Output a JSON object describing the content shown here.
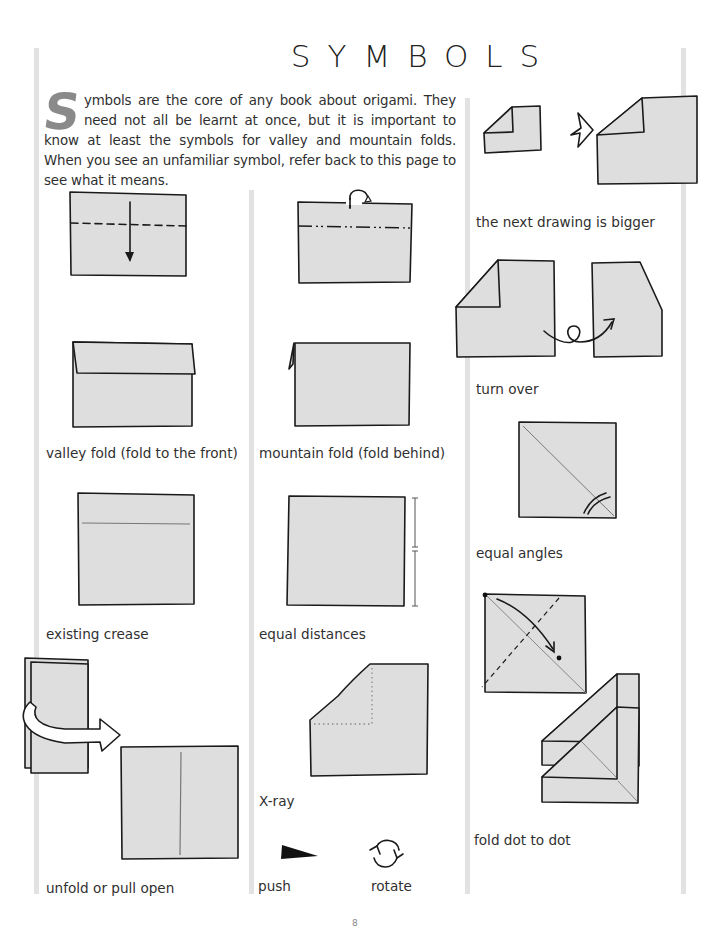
{
  "page": {
    "title": "SYMBOLS",
    "intro_dropcap": "S",
    "intro_text": "ymbols are the core of any book about origami. They need not all be learnt at once, but it is important to know at least the symbols for valley and mountain folds. When you see an unfamiliar symbol, refer back to this page to see what it means.",
    "page_number": "8"
  },
  "colors": {
    "paper_fill": "#dedede",
    "ink": "#1a1a1a",
    "rule": "#e2e2e2",
    "dropcap": "#8a8a8a"
  },
  "symbols": [
    {
      "id": "valley-fold",
      "caption": "valley fold (fold to the front)",
      "icon": "valley-fold-diagram"
    },
    {
      "id": "mountain-fold",
      "caption": "mountain fold (fold behind)",
      "icon": "mountain-fold-diagram"
    },
    {
      "id": "existing-crease",
      "caption": "existing crease",
      "icon": "existing-crease-diagram"
    },
    {
      "id": "equal-distances",
      "caption": "equal distances",
      "icon": "equal-distances-diagram"
    },
    {
      "id": "unfold",
      "caption": "unfold or pull open",
      "icon": "unfold-arrow-diagram"
    },
    {
      "id": "x-ray",
      "caption": "X-ray",
      "icon": "x-ray-diagram"
    },
    {
      "id": "push",
      "caption": "push",
      "icon": "push-arrowhead"
    },
    {
      "id": "rotate",
      "caption": "rotate",
      "icon": "rotate-circle-arrows"
    },
    {
      "id": "bigger",
      "caption": "the next drawing is bigger",
      "icon": "bigger-star-arrow"
    },
    {
      "id": "turn-over",
      "caption": "turn over",
      "icon": "turn-over-loop-arrow"
    },
    {
      "id": "equal-angles",
      "caption": "equal angles",
      "icon": "equal-angles-diagram"
    },
    {
      "id": "dot-to-dot",
      "caption": "fold dot to dot",
      "icon": "dot-to-dot-diagram"
    }
  ]
}
